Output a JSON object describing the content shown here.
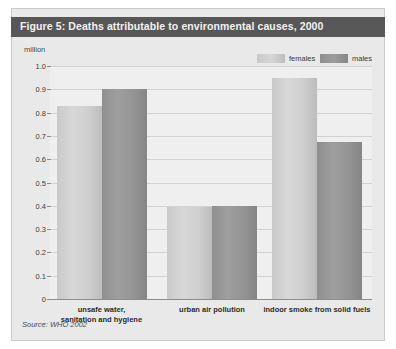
{
  "figure": {
    "title": "Figure 5: Deaths attributable to environmental causes, 2000",
    "source": "Source: WHO 2002",
    "axis_unit": "million",
    "title_bar_color": "#575757",
    "panel_color": "#e9e9e9",
    "plot_color": "#efefef"
  },
  "legend": {
    "position": "top-right",
    "items": [
      {
        "label": "females",
        "color": "#cfcfcf"
      },
      {
        "label": "males",
        "color": "#949494"
      }
    ]
  },
  "chart_data": {
    "type": "bar",
    "title": "Figure 5: Deaths attributable to environmental causes, 2000",
    "subtitle": "",
    "xlabel": "",
    "ylabel": "million",
    "ylim": [
      0,
      1.0
    ],
    "ytick_labels": [
      "1.0",
      "0.9",
      "0.8",
      "0.7",
      "0.6",
      "0.5",
      "0.4",
      "0.3",
      "0.2",
      "0.1",
      "0"
    ],
    "ytick_values": [
      1.0,
      0.9,
      0.8,
      0.7,
      0.6,
      0.5,
      0.4,
      0.3,
      0.2,
      0.1,
      0
    ],
    "grid": true,
    "grid_axis": "y",
    "legend_position": "top-right",
    "categories": [
      "unsafe water, sanitation and hygiene",
      "urban air pollution",
      "indoor smoke from solid fuels"
    ],
    "category_lines": [
      [
        "unsafe water,",
        "sanitation and hygiene"
      ],
      [
        "urban air pollution"
      ],
      [
        "indoor smoke from solid fuels"
      ]
    ],
    "series": [
      {
        "name": "females",
        "color": "#cfcfcf",
        "values": [
          0.83,
          0.395,
          0.95
        ]
      },
      {
        "name": "males",
        "color": "#949494",
        "values": [
          0.9,
          0.4,
          0.675
        ]
      }
    ],
    "annotations": [
      "Source: WHO 2002"
    ]
  }
}
